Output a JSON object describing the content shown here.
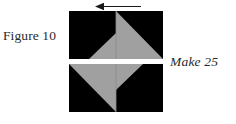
{
  "figure": {
    "label": "Figure 10",
    "instruction": "Make 25",
    "colors": {
      "dark": "#000000",
      "light": "#a0a0a0",
      "background": "#ffffff",
      "seam": "#8a8a8a",
      "text": "#2b2b2b",
      "arrow": "#1a1a1a"
    },
    "arrow": {
      "name": "direction-arrow",
      "direction": "left"
    },
    "blocks": [
      {
        "name": "upper-block",
        "quadrants": [
          {
            "name": "top-left-quadrant",
            "fill": "dark",
            "accent": "corner-triangle-bottom-right",
            "accent_fill": "light"
          },
          {
            "name": "top-right-quadrant",
            "fill": "dark",
            "accent": "half-triangle-lower-left",
            "accent_fill": "light"
          }
        ]
      },
      {
        "name": "lower-block",
        "quadrants": [
          {
            "name": "bottom-left-quadrant",
            "fill": "dark",
            "accent": "half-triangle-upper-right",
            "accent_fill": "light"
          },
          {
            "name": "bottom-right-quadrant",
            "fill": "dark",
            "accent": "corner-triangle-top-left",
            "accent_fill": "light"
          }
        ]
      }
    ]
  }
}
